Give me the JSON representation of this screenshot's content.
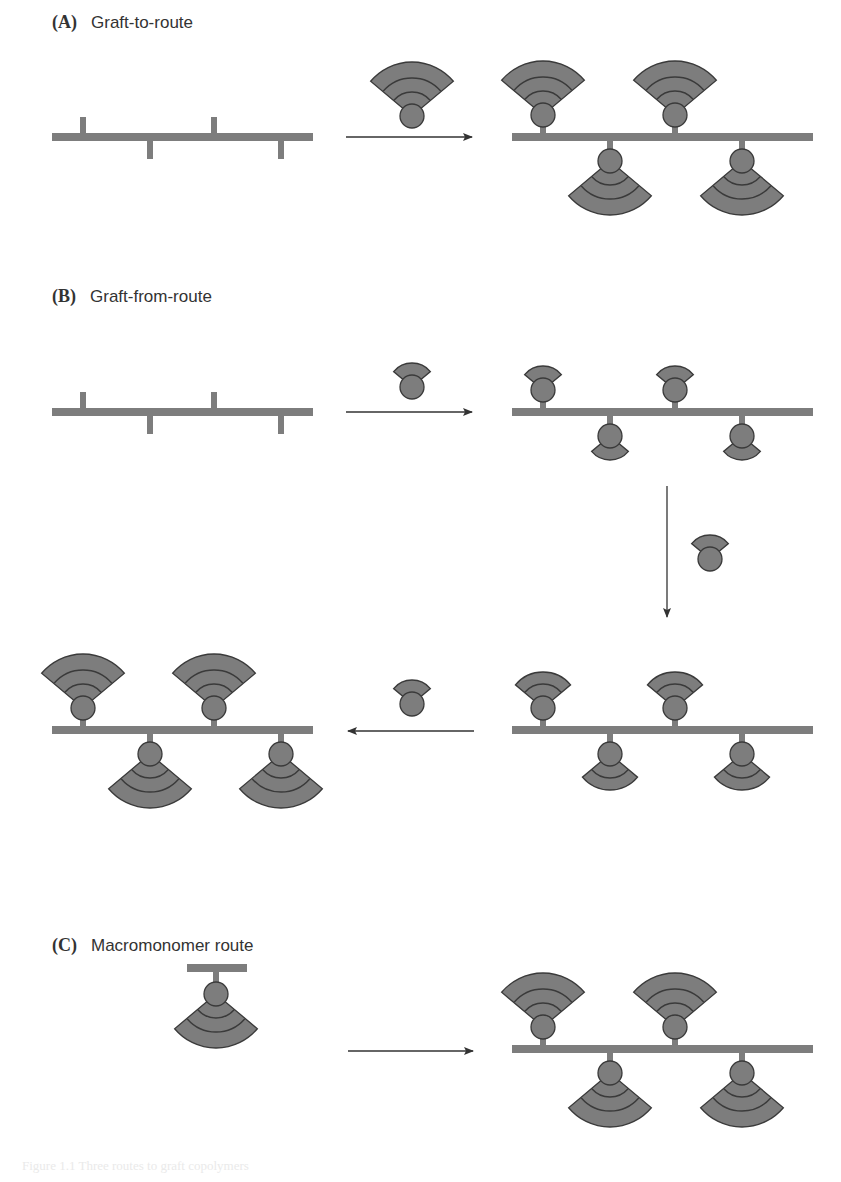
{
  "colors": {
    "polymer": "#7d7d7d",
    "outline": "#3a3a3a",
    "arrow": "#333333",
    "text": "#333333"
  },
  "panels": [
    {
      "letter": "(A)",
      "title": "Graft-to-route",
      "label_pos": [
        52,
        12
      ]
    },
    {
      "letter": "(B)",
      "title": "Graft-from-route",
      "label_pos": [
        52,
        286
      ]
    },
    {
      "letter": "(C)",
      "title": "Macromonomer route",
      "label_pos": [
        52,
        935
      ]
    }
  ],
  "diagram": {
    "backbones": [
      {
        "id": "A-start",
        "x1": 52,
        "x2": 313,
        "y": 137,
        "stubs_up": [
          83,
          214
        ],
        "stubs_down": [
          150,
          281
        ]
      },
      {
        "id": "A-product",
        "x1": 512,
        "x2": 813,
        "y": 137,
        "grafts_up": [
          543,
          675
        ],
        "grafts_down": [
          610,
          742
        ],
        "size": "large"
      },
      {
        "id": "B-start",
        "x1": 52,
        "x2": 313,
        "y": 412,
        "stubs_up": [
          83,
          214
        ],
        "stubs_down": [
          150,
          281
        ]
      },
      {
        "id": "B-step1",
        "x1": 512,
        "x2": 813,
        "y": 412,
        "grafts_up": [
          543,
          675
        ],
        "grafts_down": [
          610,
          742
        ],
        "size": "small"
      },
      {
        "id": "B-step2",
        "x1": 512,
        "x2": 813,
        "y": 730,
        "grafts_up": [
          543,
          675
        ],
        "grafts_down": [
          610,
          742
        ],
        "size": "medium"
      },
      {
        "id": "B-step3",
        "x1": 52,
        "x2": 313,
        "y": 730,
        "grafts_up": [
          83,
          214
        ],
        "grafts_down": [
          150,
          281
        ],
        "size": "large"
      },
      {
        "id": "C-product",
        "x1": 512,
        "x2": 813,
        "y": 1049,
        "grafts_up": [
          543,
          675
        ],
        "grafts_down": [
          610,
          742
        ],
        "size": "large"
      }
    ],
    "free_units": [
      {
        "id": "A-polymer-chain",
        "cx": 412,
        "cy": 116,
        "size": "large"
      },
      {
        "id": "B-monomer-1",
        "cx": 412,
        "cy": 387,
        "size": "small"
      },
      {
        "id": "B-monomer-2",
        "cx": 710,
        "cy": 559,
        "size": "small"
      },
      {
        "id": "B-monomer-3",
        "cx": 412,
        "cy": 704,
        "size": "small"
      }
    ],
    "macromonomer": {
      "cx": 216,
      "bar_y": 968,
      "bar_x1": 187,
      "bar_x2": 247,
      "size": "large"
    },
    "arrows": [
      {
        "id": "A-arrow",
        "x1": 346,
        "y1": 137,
        "x2": 472,
        "y2": 137
      },
      {
        "id": "B-arrow-1",
        "x1": 346,
        "y1": 412,
        "x2": 472,
        "y2": 412
      },
      {
        "id": "B-arrow-2",
        "x1": 667,
        "y1": 486,
        "x2": 667,
        "y2": 617
      },
      {
        "id": "B-arrow-3",
        "x1": 474,
        "y1": 731,
        "x2": 348,
        "y2": 731
      },
      {
        "id": "C-arrow",
        "x1": 348,
        "y1": 1051,
        "x2": 473,
        "y2": 1051
      }
    ]
  },
  "caption": "Figure 1.1  Three routes to graft copolymers"
}
